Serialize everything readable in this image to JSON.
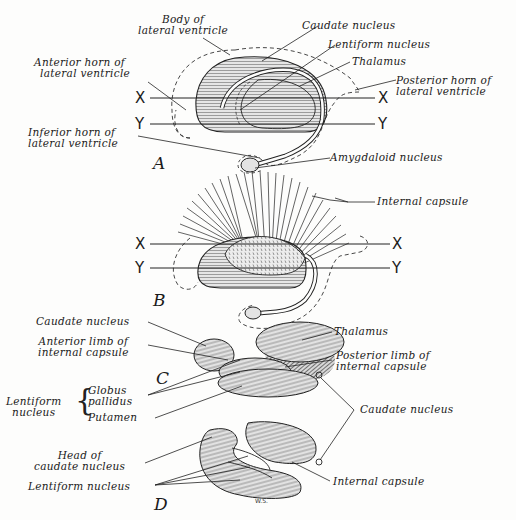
{
  "figure": {
    "panels": [
      {
        "id": "A",
        "label": "A",
        "axis_lines": [
          "X",
          "Y"
        ],
        "annotations": [
          {
            "text_lines": [
              "Body of",
              "lateral ventricle"
            ]
          },
          {
            "text_lines": [
              "Caudate nucleus"
            ]
          },
          {
            "text_lines": [
              "Lentiform nucleus"
            ]
          },
          {
            "text_lines": [
              "Thalamus"
            ]
          },
          {
            "text_lines": [
              "Anterior horn of",
              "lateral ventricle"
            ]
          },
          {
            "text_lines": [
              "Posterior horn of",
              "lateral ventricle"
            ]
          },
          {
            "text_lines": [
              "Inferior horn of",
              "lateral ventricle"
            ]
          },
          {
            "text_lines": [
              "Amygdaloid nucleus"
            ]
          }
        ]
      },
      {
        "id": "B",
        "label": "B",
        "axis_lines": [
          "X",
          "Y"
        ],
        "annotations": [
          {
            "text_lines": [
              "Internal capsule"
            ]
          }
        ]
      },
      {
        "id": "C",
        "label": "C",
        "annotations": [
          {
            "text_lines": [
              "Caudate nucleus"
            ]
          },
          {
            "text_lines": [
              "Anterior limb of",
              "internal capsule"
            ]
          },
          {
            "text_lines": [
              "Thalamus"
            ]
          },
          {
            "text_lines": [
              "Posterior limb of",
              "internal capsule"
            ]
          },
          {
            "group": "Lentiform nucleus",
            "group_lines": [
              "Lentiform",
              "nucleus"
            ],
            "members": [
              "Globus",
              "pallidus",
              "Putamen"
            ]
          }
        ]
      },
      {
        "id": "D",
        "label": "D",
        "annotations": [
          {
            "text_lines": [
              "Head of",
              "caudate nucleus"
            ]
          },
          {
            "text_lines": [
              "Lentiform nucleus"
            ]
          },
          {
            "text_lines": [
              "Internal capsule"
            ]
          }
        ]
      }
    ],
    "shared_annotations": {
      "caudate_tail": {
        "text_lines": [
          "Caudate nucleus"
        ]
      }
    },
    "signature": "W.S."
  }
}
